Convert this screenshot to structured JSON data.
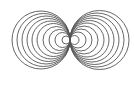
{
  "diagram": {
    "stroke_color": "#555555",
    "background": "#ffffff",
    "tangent_point": {
      "x": 70,
      "y": 40
    },
    "left_radii": [
      29,
      26.5,
      24,
      21.5,
      19,
      16.5,
      13.5,
      10.5,
      7.5,
      4
    ],
    "right_radii": [
      29.5,
      27,
      24.5,
      22,
      19.5,
      17,
      14,
      11,
      8,
      4.5
    ]
  }
}
